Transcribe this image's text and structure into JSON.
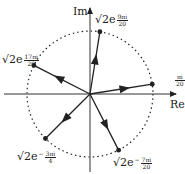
{
  "axes": {
    "real_label": "Re",
    "imag_label": "Im"
  },
  "circle": {
    "radius_label": "√2",
    "style": "dotted"
  },
  "vectors": [
    {
      "prefix": "√2e",
      "sign": "",
      "num": "9πi",
      "den": "20",
      "angle_deg": 81
    },
    {
      "prefix": "√2e",
      "sign": "",
      "num": "17πi",
      "den": "20",
      "angle_deg": 153
    },
    {
      "prefix": "",
      "sign": "",
      "num": "πi",
      "den": "20",
      "angle_deg": 9
    },
    {
      "prefix": "√2e",
      "sign": "−",
      "num": "3πi",
      "den": "4",
      "angle_deg": -135
    },
    {
      "prefix": "√2e",
      "sign": "−",
      "num": "7πi",
      "den": "20",
      "angle_deg": -63
    }
  ]
}
